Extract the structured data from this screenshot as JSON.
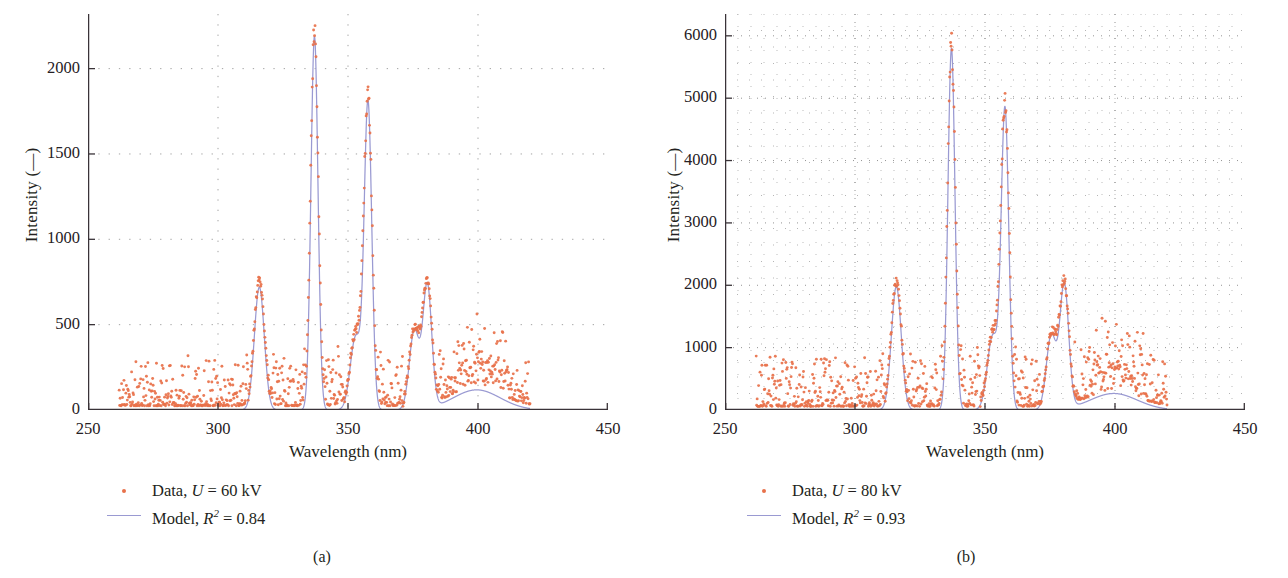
{
  "figure": {
    "panels": [
      {
        "id": "a",
        "caption": "(a)",
        "axis": {
          "xlabel": "Wavelength (nm)",
          "ylabel": "Intensity (—)",
          "xticks": [
            "250",
            "300",
            "350",
            "400",
            "450"
          ],
          "yticks": [
            "0",
            "500",
            "1000",
            "1500",
            "2000"
          ]
        },
        "legend": [
          {
            "marker": "dot",
            "label_plain": "Data, U = 60 kV",
            "prefix": "Data, ",
            "sym": "U",
            "mid": " = 60 kV",
            "sup": ""
          },
          {
            "marker": "line",
            "label_plain": "Model, R2 = 0.84",
            "prefix": "Model, ",
            "sym": "R",
            "sup": "2",
            "mid": " = 0.84"
          }
        ]
      },
      {
        "id": "b",
        "caption": "(b)",
        "axis": {
          "xlabel": "Wavelength (nm)",
          "ylabel": "Intensity (—)",
          "xticks": [
            "250",
            "300",
            "350",
            "400",
            "450"
          ],
          "yticks": [
            "0",
            "1000",
            "2000",
            "3000",
            "4000",
            "5000",
            "6000"
          ]
        },
        "legend": [
          {
            "marker": "dot",
            "label_plain": "Data, U = 80 kV",
            "prefix": "Data, ",
            "sym": "U",
            "mid": " = 80 kV",
            "sup": ""
          },
          {
            "marker": "line",
            "label_plain": "Model, R2 = 0.93",
            "prefix": "Model, ",
            "sym": "R",
            "sup": "2",
            "mid": " = 0.93"
          }
        ]
      }
    ]
  },
  "colors": {
    "data_points": "#e8714a",
    "model_line": "#9a9ad2",
    "axis": "#3a3338",
    "grid": "#6b6b6b",
    "text": "#231f20"
  },
  "chart_data": [
    {
      "type": "scatter",
      "panel": "a",
      "title": "",
      "xlabel": "Wavelength (nm)",
      "ylabel": "Intensity (—)",
      "xlim": [
        250,
        450
      ],
      "ylim": [
        0,
        2320
      ],
      "xticks": [
        250,
        300,
        350,
        400,
        450
      ],
      "yticks": [
        0,
        500,
        1000,
        1500,
        2000
      ],
      "grid": "dotted",
      "legend_position": "below-left",
      "data_range_nm": [
        262,
        420
      ],
      "noise_baseline": 55,
      "noise_amplitude": 95,
      "noise_seed": 17,
      "series": [
        {
          "name": "Data, U = 60 kV",
          "kind": "scatter",
          "color": "#e8714a",
          "peaks": [
            {
              "center": 315.9,
              "height": 760,
              "width": 2.0
            },
            {
              "center": 337.1,
              "height": 2200,
              "width": 1.5
            },
            {
              "center": 353.0,
              "height": 440,
              "width": 2.2
            },
            {
              "center": 357.7,
              "height": 1790,
              "width": 1.6
            },
            {
              "center": 375.5,
              "height": 470,
              "width": 2.0
            },
            {
              "center": 380.5,
              "height": 730,
              "width": 1.8
            },
            {
              "center": 399.5,
              "height": 120,
              "width": 9.0
            }
          ]
        },
        {
          "name": "Model, R2 = 0.84",
          "kind": "line",
          "color": "#9a9ad2",
          "r_squared": 0.84,
          "peaks": [
            {
              "center": 315.9,
              "height": 720,
              "width": 1.9
            },
            {
              "center": 337.1,
              "height": 2190,
              "width": 1.35
            },
            {
              "center": 353.0,
              "height": 430,
              "width": 2.1
            },
            {
              "center": 357.7,
              "height": 1780,
              "width": 1.45
            },
            {
              "center": 375.5,
              "height": 460,
              "width": 1.9
            },
            {
              "center": 380.5,
              "height": 720,
              "width": 1.7
            },
            {
              "center": 399.5,
              "height": 118,
              "width": 9.0
            }
          ]
        }
      ]
    },
    {
      "type": "scatter",
      "panel": "b",
      "title": "",
      "xlabel": "Wavelength (nm)",
      "ylabel": "Intensity (—)",
      "xlim": [
        250,
        450
      ],
      "ylim": [
        0,
        6350
      ],
      "xticks": [
        250,
        300,
        350,
        400,
        450
      ],
      "yticks": [
        0,
        1000,
        2000,
        3000,
        4000,
        5000,
        6000
      ],
      "grid": "dotted-dense",
      "legend_position": "below-left",
      "data_range_nm": [
        262,
        420
      ],
      "noise_baseline": 130,
      "noise_amplitude": 260,
      "noise_seed": 43,
      "series": [
        {
          "name": "Data, U = 80 kV",
          "kind": "scatter",
          "color": "#e8714a",
          "peaks": [
            {
              "center": 315.9,
              "height": 2050,
              "width": 2.0
            },
            {
              "center": 337.1,
              "height": 5820,
              "width": 1.5
            },
            {
              "center": 353.0,
              "height": 1220,
              "width": 2.2
            },
            {
              "center": 357.7,
              "height": 4780,
              "width": 1.6
            },
            {
              "center": 375.5,
              "height": 1220,
              "width": 2.0
            },
            {
              "center": 380.5,
              "height": 2000,
              "width": 1.8
            },
            {
              "center": 399.5,
              "height": 270,
              "width": 9.0
            }
          ]
        },
        {
          "name": "Model, R2 = 0.93",
          "kind": "line",
          "color": "#9a9ad2",
          "r_squared": 0.93,
          "peaks": [
            {
              "center": 315.9,
              "height": 1980,
              "width": 1.9
            },
            {
              "center": 337.1,
              "height": 5800,
              "width": 1.35
            },
            {
              "center": 353.0,
              "height": 1190,
              "width": 2.1
            },
            {
              "center": 357.7,
              "height": 4770,
              "width": 1.45
            },
            {
              "center": 375.5,
              "height": 1190,
              "width": 1.9
            },
            {
              "center": 380.5,
              "height": 1980,
              "width": 1.7
            },
            {
              "center": 399.5,
              "height": 265,
              "width": 9.0
            }
          ]
        }
      ]
    }
  ]
}
